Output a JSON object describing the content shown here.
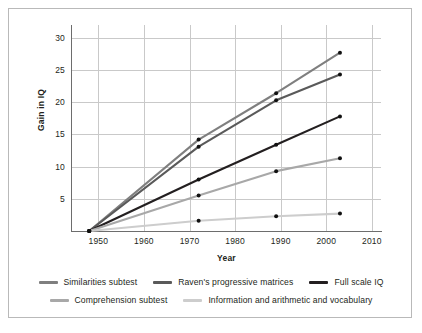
{
  "chart_data": {
    "type": "line",
    "title": "",
    "xlabel": "Year",
    "ylabel": "Gain in IQ",
    "xlim": [
      1944,
      2012
    ],
    "ylim": [
      0,
      32
    ],
    "xticks": [
      "1950",
      "1960",
      "1970",
      "1980",
      "1990",
      "2000",
      "2010"
    ],
    "xtick_values": [
      1950,
      1960,
      1970,
      1980,
      1990,
      2000,
      2010
    ],
    "yticks": [
      "5",
      "10",
      "15",
      "20",
      "25",
      "30"
    ],
    "ytick_values": [
      5,
      10,
      15,
      20,
      25,
      30
    ],
    "grid": true,
    "legend_position": "bottom",
    "x": [
      1948,
      1972,
      1989,
      2003
    ],
    "series": [
      {
        "name": "Similarities subtest",
        "color": "#7f7f7f",
        "values": [
          0,
          14.2,
          21.4,
          27.7
        ]
      },
      {
        "name": "Raven's progressive matrices",
        "color": "#5a5a5a",
        "values": [
          0,
          13.1,
          20.3,
          24.3
        ]
      },
      {
        "name": "Full scale IQ",
        "color": "#231f20",
        "values": [
          0,
          8.0,
          13.4,
          17.8
        ]
      },
      {
        "name": "Comprehension subtest",
        "color": "#a8a8a8",
        "values": [
          0,
          5.5,
          9.3,
          11.3
        ]
      },
      {
        "name": "Information and arithmetic and vocabulary",
        "color": "#cdcdcd",
        "values": [
          0,
          1.6,
          2.3,
          2.7
        ]
      }
    ]
  },
  "legend": {
    "rows": [
      [
        {
          "label": "Similarities subtest",
          "color": "#7f7f7f"
        },
        {
          "label": "Raven's progressive matrices",
          "color": "#5a5a5a"
        },
        {
          "label": "Full scale IQ",
          "color": "#231f20"
        }
      ],
      [
        {
          "label": "Comprehension subtest",
          "color": "#a8a8a8"
        },
        {
          "label": "Information and arithmetic and vocabulary",
          "color": "#cdcdcd"
        }
      ]
    ]
  }
}
